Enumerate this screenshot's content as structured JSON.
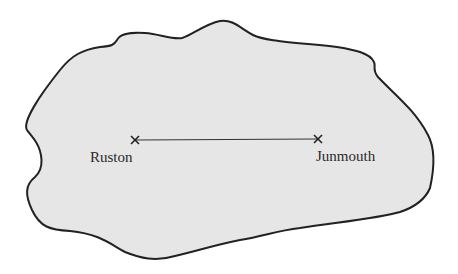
{
  "map": {
    "land_fill": "#e6e6e6",
    "outline_color": "#222222",
    "route_color": "#333333",
    "places": [
      {
        "name": "Ruston",
        "x": 135,
        "y": 140
      },
      {
        "name": "Junmouth",
        "x": 318,
        "y": 139
      }
    ],
    "marker_glyph": "×"
  }
}
